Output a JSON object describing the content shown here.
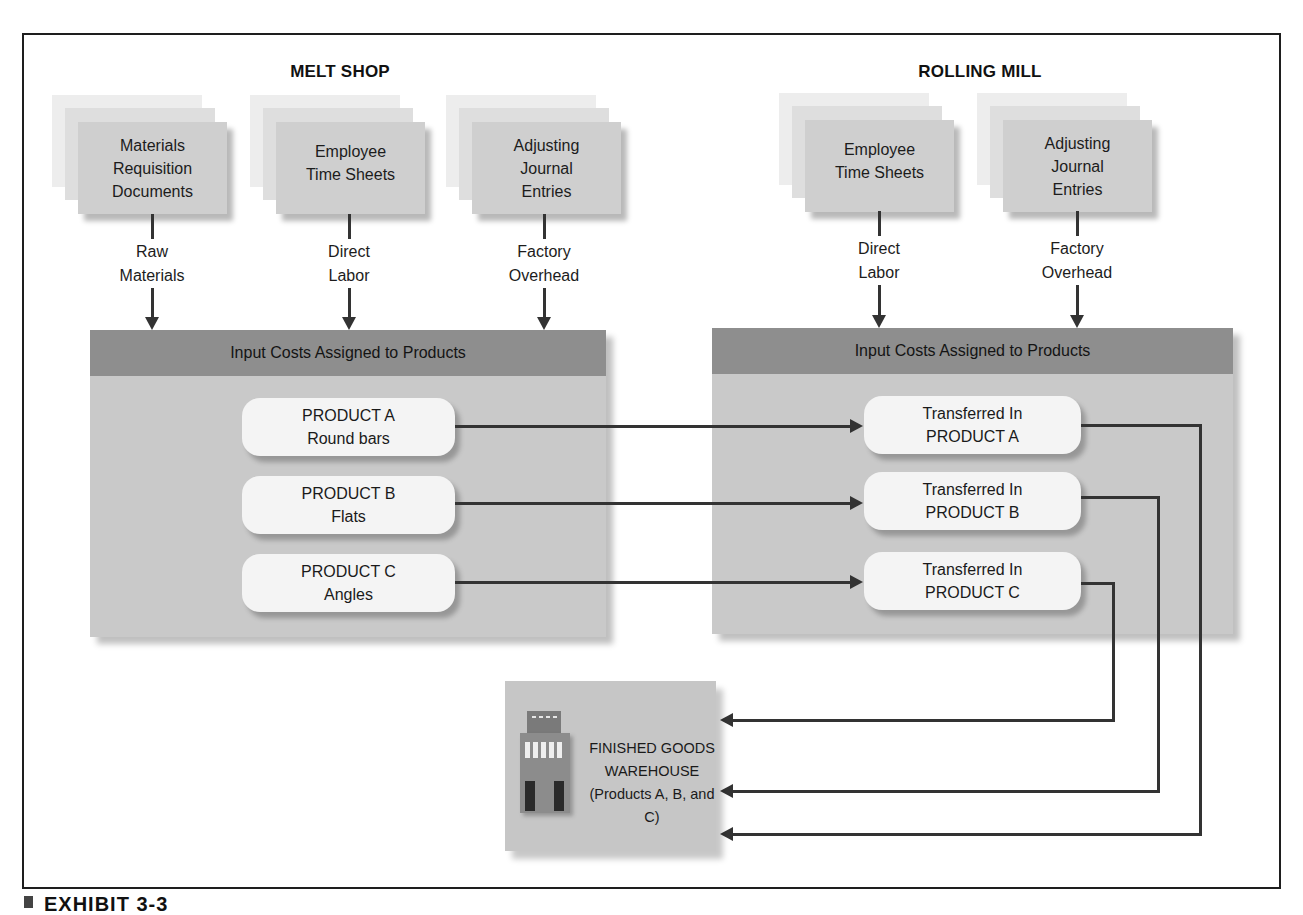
{
  "sections": {
    "melt_shop": {
      "title": "MELT SHOP",
      "sources": [
        {
          "document": "Materials Requisition Documents",
          "lines": [
            "Materials",
            "Requisition",
            "Documents"
          ],
          "cost_lines": [
            "Raw",
            "Materials"
          ]
        },
        {
          "document": "Employee Time Sheets",
          "lines": [
            "Employee",
            "Time Sheets"
          ],
          "cost_lines": [
            "Direct",
            "Labor"
          ]
        },
        {
          "document": "Adjusting Journal Entries",
          "lines": [
            "Adjusting",
            "Journal",
            "Entries"
          ],
          "cost_lines": [
            "Factory",
            "Overhead"
          ]
        }
      ],
      "box_header": "Input Costs Assigned to Products",
      "products": [
        {
          "line1": "PRODUCT A",
          "line2": "Round bars"
        },
        {
          "line1": "PRODUCT B",
          "line2": "Flats"
        },
        {
          "line1": "PRODUCT C",
          "line2": "Angles"
        }
      ]
    },
    "rolling_mill": {
      "title": "ROLLING MILL",
      "sources": [
        {
          "document": "Employee Time Sheets",
          "lines": [
            "Employee",
            "Time Sheets"
          ],
          "cost_lines": [
            "Direct",
            "Labor"
          ]
        },
        {
          "document": "Adjusting Journal Entries",
          "lines": [
            "Adjusting",
            "Journal",
            "Entries"
          ],
          "cost_lines": [
            "Factory",
            "Overhead"
          ]
        }
      ],
      "box_header": "Input Costs Assigned to Products",
      "products": [
        {
          "line1": "Transferred In",
          "line2": "PRODUCT A"
        },
        {
          "line1": "Transferred In",
          "line2": "PRODUCT B"
        },
        {
          "line1": "Transferred In",
          "line2": "PRODUCT C"
        }
      ]
    },
    "warehouse": {
      "lines": [
        "FINISHED GOODS",
        "WAREHOUSE",
        "(Products A, B, and C)"
      ],
      "icon": "building-icon"
    }
  },
  "caption": "EXHIBIT 3-3",
  "colors": {
    "header_band": "#8e8e8e",
    "box_fill": "#c9c9c9",
    "pill_fill": "#f4f4f4",
    "doc_card": "#cfcfcf",
    "arrow": "#333333"
  }
}
